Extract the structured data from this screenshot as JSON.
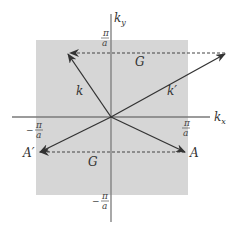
{
  "diagram": {
    "colors": {
      "zone_fill": "#d6d6d6",
      "axis": "#7a7a7a",
      "arrow": "#333333",
      "dashed": "#444444"
    },
    "axes": {
      "x_label": "k",
      "x_sub": "x",
      "y_label": "k",
      "y_sub": "y"
    },
    "ticks": {
      "pos_num": "π",
      "den": "a",
      "neg_sign": "−"
    },
    "vectors": {
      "k": "k",
      "k_prime": "k′",
      "G_top": "G",
      "G_bottom": "G",
      "A": "A",
      "A_prime": "A′"
    }
  }
}
